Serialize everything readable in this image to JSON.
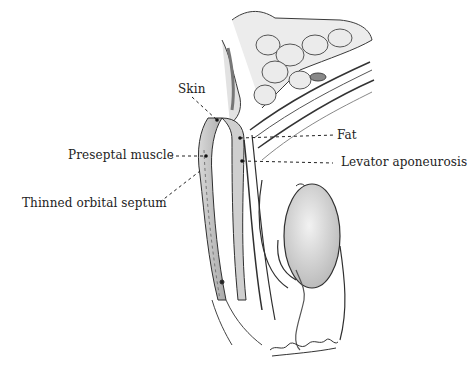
{
  "figure": {
    "labels": {
      "skin": "Skin",
      "preseptal_muscle": "Preseptal muscle",
      "thinned_orbital_septum": "Thinned orbital septum",
      "fat": "Fat",
      "levator_aponeurosis": "Levator aponeurosis"
    },
    "colors": {
      "ink": "#2a2a2a",
      "shade": "#bdbdbd",
      "background": "#ffffff"
    },
    "signature": "artist-signature"
  }
}
